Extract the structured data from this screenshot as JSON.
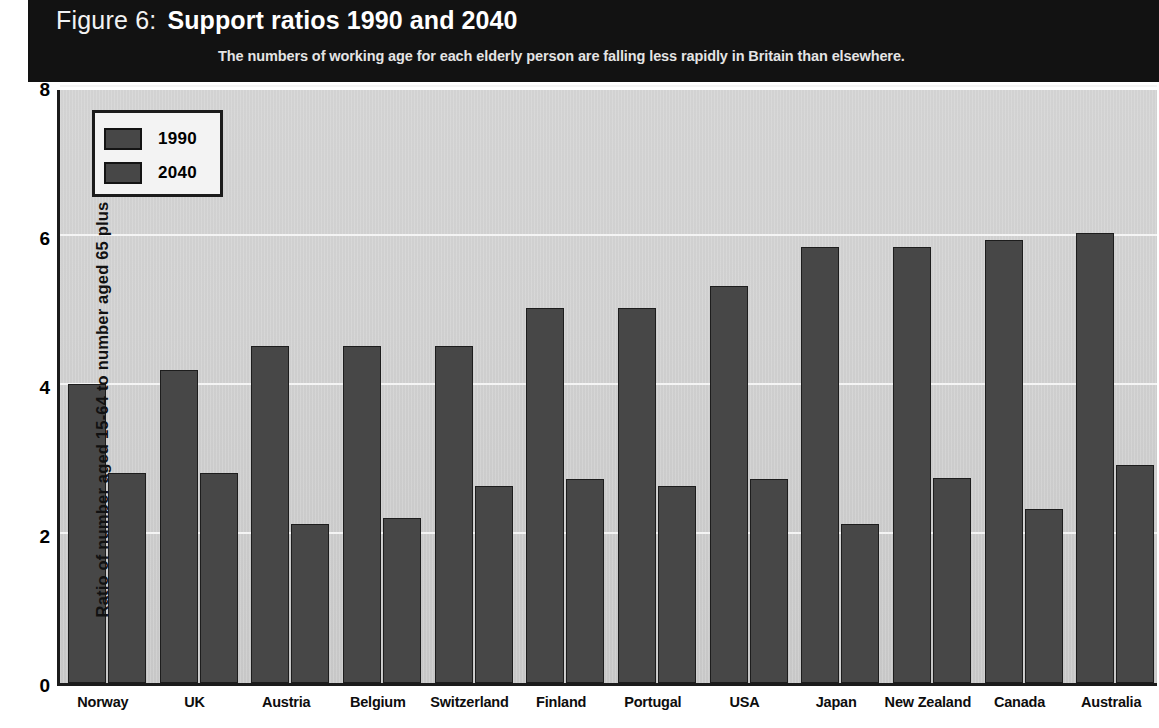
{
  "header": {
    "figure_number": "Figure 6:",
    "title": "Support ratios 1990 and 2040",
    "subtitle": "The numbers of working age for each elderly person are falling less rapidly in Britain than elsewhere.",
    "banner_color": "#121212",
    "title_color": "#ffffff"
  },
  "legend": {
    "items": [
      {
        "label": "1990",
        "color": "#474747"
      },
      {
        "label": "2040",
        "color": "#474747"
      }
    ]
  },
  "axis": {
    "y_title": "Ratio of number aged 15-64 to number aged 65 plus",
    "y_ticks": [
      "0",
      "2",
      "4",
      "6",
      "8"
    ],
    "y_tick_values": [
      0,
      2,
      4,
      6,
      8
    ]
  },
  "chart_data": {
    "type": "bar",
    "title": "Support ratios 1990 and 2040",
    "subtitle": "The numbers of working age for each elderly person are falling less rapidly in Britain than elsewhere.",
    "xlabel": "",
    "ylabel": "Ratio of number aged 15-64 to number aged 65 plus",
    "ylim": [
      0,
      8
    ],
    "yticks": [
      0,
      2,
      4,
      6,
      8
    ],
    "grid": true,
    "legend_position": "top-left",
    "categories": [
      "Norway",
      "UK",
      "Austria",
      "Belgium",
      "Switzerland",
      "Finland",
      "Portugal",
      "USA",
      "Japan",
      "New Zealand",
      "Canada",
      "Australia"
    ],
    "series": [
      {
        "name": "1990",
        "color": "#474747",
        "values": [
          4.02,
          4.2,
          4.52,
          4.52,
          4.52,
          5.03,
          5.03,
          5.33,
          5.85,
          5.85,
          5.95,
          6.04
        ]
      },
      {
        "name": "2040",
        "color": "#474747",
        "values": [
          2.82,
          2.82,
          2.13,
          2.22,
          2.64,
          2.74,
          2.64,
          2.74,
          2.14,
          2.75,
          2.34,
          2.93
        ]
      }
    ]
  },
  "colors": {
    "bar": "#474747",
    "bar_border": "#1d1d1d",
    "plot_background": "#cfcfcf",
    "gridline": "#f4f4f4",
    "axis": "#1b1b1b",
    "page": "#ffffff"
  }
}
